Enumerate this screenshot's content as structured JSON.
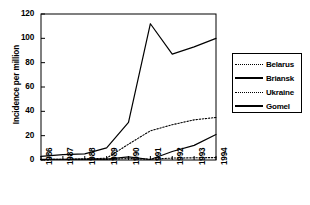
{
  "chart_data": {
    "type": "line",
    "title": "",
    "xlabel": "",
    "ylabel": "Incidence per million",
    "x": [
      1986,
      1987,
      1988,
      1989,
      1990,
      1991,
      1992,
      1993,
      1994
    ],
    "xtick_labels": [
      "1986",
      "1987",
      "1988",
      "1989",
      "1990",
      "1991",
      "1992",
      "1993",
      "1994"
    ],
    "ytick_labels": [
      "0",
      "20",
      "40",
      "60",
      "80",
      "100",
      "120"
    ],
    "yticks": [
      0,
      20,
      40,
      60,
      80,
      100,
      120
    ],
    "ylim": [
      0,
      120
    ],
    "grid": false,
    "legend_position": "right-outside",
    "series": [
      {
        "name": "Belarus",
        "style": "dotted",
        "color": "#000000",
        "values": [
          0.3,
          0.4,
          0.5,
          0.5,
          1.2,
          0.6,
          1.6,
          1.8,
          2.0
        ]
      },
      {
        "name": "Briansk",
        "style": "solid",
        "color": "#000000",
        "values": [
          0.5,
          0.6,
          0.7,
          0.8,
          2.5,
          0.4,
          7.0,
          12.0,
          21.0
        ]
      },
      {
        "name": "Ukraine",
        "style": "dotted",
        "color": "#000000",
        "values": [
          0.4,
          0.6,
          0.8,
          1.5,
          13.0,
          24.0,
          29.0,
          33.0,
          35.0
        ]
      },
      {
        "name": "Gomel",
        "style": "solid",
        "color": "#000000",
        "values": [
          3.0,
          4.5,
          5.0,
          10.0,
          31.0,
          112.0,
          87.0,
          93.0,
          100.0
        ]
      }
    ]
  },
  "legend": {
    "entries": [
      {
        "label": "Belarus"
      },
      {
        "label": "Briansk"
      },
      {
        "label": "Ukraine"
      },
      {
        "label": "Gomel"
      }
    ]
  }
}
